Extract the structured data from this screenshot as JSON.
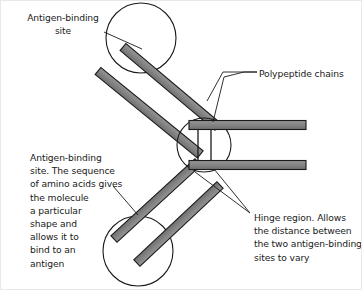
{
  "figure": {
    "background_color": "#ffffff",
    "border_color": "#e8e8e8",
    "bar_fill_color": "#808080",
    "bar_edge_color": "#1a1a1a",
    "outline_color": "#1a1a1a",
    "text_color": "#1a1a1a"
  },
  "labels": {
    "antigen_binding_top": "Antigen-binding\nsite",
    "polypeptide_chains": "Polypeptide chains",
    "antigen_binding_detail": "Antigen-binding\nsite.  The sequence\nof amino acids gives\nthe molecule\na particular\nshape and\nallows it to\nbind to an\nantigen",
    "hinge_region": "Hinge region.  Allows\nthe distance between\nthe two antigen-binding\nsites to vary"
  },
  "shapes": {
    "circles": [
      {
        "name": "antigen-binding-site-top",
        "cx": 140,
        "cy": 37,
        "r": 35
      },
      {
        "name": "hinge-region-circle",
        "cx": 203,
        "cy": 144,
        "r": 27
      },
      {
        "name": "antigen-binding-site-bottom",
        "cx": 137,
        "cy": 250,
        "r": 35
      }
    ],
    "bars": [
      {
        "name": "upper-arm-outer-chain",
        "x1": 122,
        "y1": 46,
        "x2": 216,
        "y2": 125,
        "thickness": 9
      },
      {
        "name": "upper-arm-inner-chain",
        "x1": 97,
        "y1": 70,
        "x2": 199,
        "y2": 153,
        "thickness": 9
      },
      {
        "name": "right-upper-chain",
        "x1": 189,
        "y1": 124,
        "x2": 305,
        "y2": 124,
        "thickness": 9
      },
      {
        "name": "right-lower-chain",
        "x1": 189,
        "y1": 164,
        "x2": 305,
        "y2": 164,
        "thickness": 9
      },
      {
        "name": "lower-arm-outer-chain",
        "x1": 197,
        "y1": 161,
        "x2": 113,
        "y2": 238,
        "thickness": 9
      },
      {
        "name": "lower-arm-inner-chain",
        "x1": 219,
        "y1": 184,
        "x2": 136,
        "y2": 262,
        "thickness": 9
      }
    ],
    "hinge_links": [
      {
        "name": "hinge-link-left",
        "x": 197,
        "y1": 128,
        "y2": 160
      },
      {
        "name": "hinge-link-right",
        "x": 210,
        "y1": 128,
        "y2": 160
      }
    ],
    "leader_lines": [
      {
        "name": "leader-antigen-top",
        "points": "103,31 140,48"
      },
      {
        "name": "leader-polypeptide-upper",
        "points": "255,70 221,70 207,102"
      },
      {
        "name": "leader-polypeptide-lower",
        "points": "255,70 255,76 243,76 243,76 247,76"
      },
      {
        "name": "leader-antigen-detail",
        "points": "113,185 136,213"
      },
      {
        "name": "leader-hinge-upper",
        "points": "248,212 212,168"
      },
      {
        "name": "leader-hinge-lower",
        "points": "248,212 196,172"
      }
    ]
  }
}
